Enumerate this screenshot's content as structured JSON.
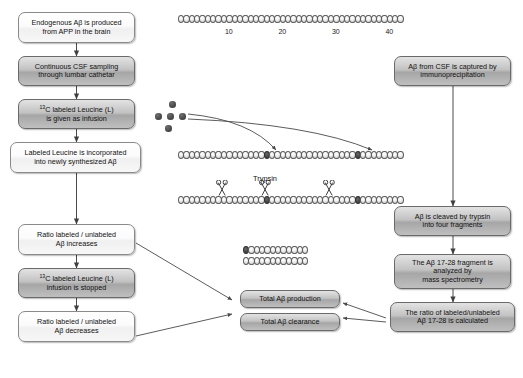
{
  "diagram": {
    "left_column": [
      {
        "id": "endogenous",
        "label": "Endogenous Aβ is produced\nfrom APP in the brain",
        "style": "light"
      },
      {
        "id": "csf-sampling",
        "label": "Continuous CSF sampling\nthrough lumbar cathetar",
        "style": "dark"
      },
      {
        "id": "leucine-inf",
        "label": "13C labeled Leucine (L)\nis given as infusion",
        "style": "dark",
        "sup": "13"
      },
      {
        "id": "incorporated",
        "label": "Labeled Leucine is incorporated\ninto newly synthesized Aβ",
        "style": "light"
      },
      {
        "id": "ratio-up",
        "label": "Ratio labeled / unlabeled\nAβ increases",
        "style": "light"
      },
      {
        "id": "infusion-stop",
        "label": "13C labeled Leucine (L)\ninfusion is stopped",
        "style": "dark",
        "sup": "13"
      },
      {
        "id": "ratio-down",
        "label": "Ratio labeled / unlabeled\nAβ decreases",
        "style": "light"
      }
    ],
    "right_column": [
      {
        "id": "immunoprecipitation",
        "label": "Aβ from CSF is captured by\nimmunoprecipitation",
        "style": "dark"
      },
      {
        "id": "trypsin-cleave",
        "label": "Aβ is cleaved by trypsin\ninto four fragments",
        "style": "dark"
      },
      {
        "id": "mass-spec",
        "label": "The Aβ 17-28 fragment is\nanalyzed by\nmass spectrometry",
        "style": "dark"
      },
      {
        "id": "ratio-calculated",
        "label": "The ratio of labeled/unlabeled\nAβ 17-28 is calculated",
        "style": "dark"
      }
    ],
    "outcomes": [
      {
        "id": "total-production",
        "label": "Total Aβ production",
        "style": "dark"
      },
      {
        "id": "total-clearance",
        "label": "Total Aβ clearance",
        "style": "dark"
      }
    ],
    "peptide": {
      "length": 42,
      "tick_labels": [
        "10",
        "20",
        "30",
        "40"
      ],
      "tick_positions": [
        10,
        20,
        30,
        40
      ],
      "labeled_residues": [
        17,
        34
      ],
      "trypsin_label": "Trypsin",
      "cleavage_sites": [
        9,
        17,
        29
      ],
      "fragment_length": 12,
      "fragment_labeled_first": true,
      "leucine_dot_count": 5
    },
    "colors": {
      "box_border": "#6e6e6e",
      "box_fill_dark": "#bdbdbd",
      "box_fill_light": "#f4f4f4",
      "residue_unlabeled": "#e8e8e8",
      "residue_labeled": "#3f3f3f",
      "arrow": "#4a4a4a",
      "text": "#111111"
    }
  }
}
